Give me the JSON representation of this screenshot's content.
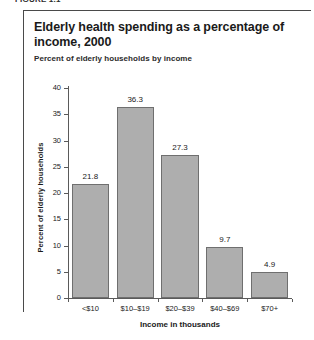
{
  "figure": {
    "caption": "FIGURE 1.1"
  },
  "chart_data": {
    "type": "bar",
    "title": "Elderly health spending as a percentage of income, 2000",
    "subtitle": "Percent of elderly households by income",
    "xlabel": "Income in thousands",
    "ylabel": "Percent of elderly households",
    "categories": [
      "<$10",
      "$10–$19",
      "$20–$39",
      "$40–$69",
      "$70+"
    ],
    "values": [
      21.8,
      36.3,
      27.3,
      9.7,
      4.9
    ],
    "value_labels": [
      "21.8",
      "36.3",
      "27.3",
      "9.7",
      "4.9"
    ],
    "ylim": [
      0,
      40
    ],
    "yticks": [
      0,
      5,
      10,
      15,
      20,
      25,
      30,
      35,
      40
    ],
    "ytick_labels": [
      "0",
      "5",
      "10",
      "15",
      "20",
      "25",
      "30",
      "35",
      "40"
    ],
    "grid": false,
    "legend": false,
    "bar_color": "#aeaeae",
    "bar_edge_color": "#6f6f6f",
    "background": "#ffffff"
  }
}
